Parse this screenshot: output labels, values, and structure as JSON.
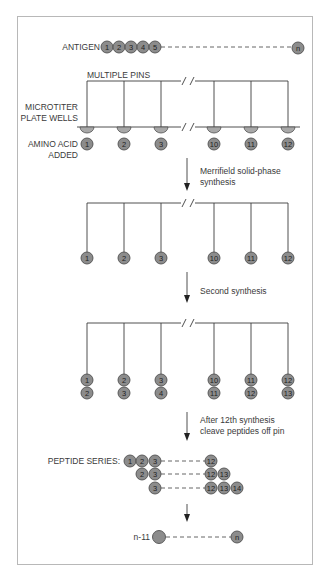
{
  "diagram": {
    "antigen": {
      "label": "ANTIGEN",
      "residues": [
        "1",
        "2",
        "3",
        "4",
        "5"
      ],
      "terminal": "n"
    },
    "setup": {
      "pins_label": "MULTIPLE PINS",
      "wells_label_line1": "MICROTITER",
      "wells_label_line2": "PLATE WELLS",
      "amino_label_line1": "AMINO ACID",
      "amino_label_line2": "ADDED",
      "amino_acids": [
        "1",
        "2",
        "3",
        "10",
        "11",
        "12"
      ]
    },
    "step1": {
      "caption_line1": "Merrifield solid-phase",
      "caption_line2": "synthesis",
      "pin_tips": [
        "1",
        "2",
        "3",
        "10",
        "11",
        "12"
      ]
    },
    "step2": {
      "caption": "Second synthesis",
      "pin_tips_top": [
        "1",
        "2",
        "3",
        "10",
        "11",
        "12"
      ],
      "pin_tips_bottom": [
        "2",
        "3",
        "4",
        "11",
        "12",
        "13"
      ]
    },
    "step3": {
      "caption_line1": "After 12th synthesis",
      "caption_line2": "cleave peptides off pin"
    },
    "peptide_series": {
      "label": "PEPTIDE SERIES:",
      "rows": [
        {
          "start": [
            "1",
            "2",
            "3"
          ],
          "end": [
            "12"
          ]
        },
        {
          "start": [
            "2",
            "3"
          ],
          "end": [
            "12",
            "13"
          ]
        },
        {
          "start": [
            "3"
          ],
          "end": [
            "12",
            "13",
            "14"
          ]
        }
      ]
    },
    "final": {
      "start_label": "n-11",
      "end": "n"
    },
    "colors": {
      "ball_fill": "#8c8c8c",
      "ball_stroke": "#505050",
      "line": "#3c3c3c",
      "frame": "#b8b8b8"
    }
  }
}
